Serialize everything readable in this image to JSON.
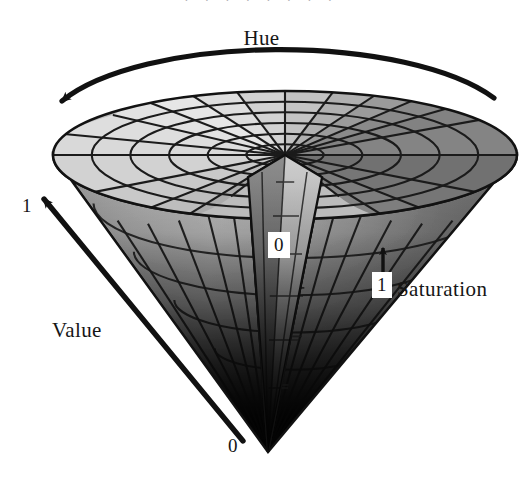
{
  "figure": {
    "title_visible": false,
    "colorspace": "grayscale",
    "background_color": "#ffffff",
    "ink_color": "#161616"
  },
  "labels": {
    "hue": "Hue",
    "value": "Value",
    "saturation": "Saturation"
  },
  "ticks": {
    "value_max": "1",
    "value_min": "0",
    "saturation_min": "0",
    "saturation_max": "1"
  },
  "scan": {
    "top_remnant": ". . . . . . . ."
  },
  "axes": {
    "hue": {
      "label": "Hue",
      "type": "angular",
      "arrow": "arc",
      "direction": "right-to-left",
      "arrowhead_at": "left"
    },
    "value": {
      "label": "Value",
      "type": "linear",
      "arrow": "straight",
      "min": "0",
      "max": "1",
      "direction": "apex-to-rim",
      "arrowhead_at": "upper-left"
    },
    "saturation": {
      "label": "Saturation",
      "type": "radial",
      "arrow": "straight",
      "min": "0",
      "max": "1",
      "direction": "center-to-rim",
      "arrowhead_at": "right"
    }
  },
  "geometry": {
    "cone_apex": {
      "x": 268,
      "y": 452
    },
    "disc_center": {
      "x": 285,
      "y": 155
    },
    "disc_radius_x": 232,
    "disc_radius_y": 64,
    "hue_sectors": 18,
    "saturation_rings": 6,
    "wedge_cut": true,
    "wedge_start_deg": 252,
    "wedge_end_deg": 288
  },
  "shading": {
    "sector_grays": [
      "#d9d9d9",
      "#d2d2d2",
      "#c9c9c9",
      "#bdbdbd",
      "#ababab",
      "#9a9a9a",
      "#8c8c8c",
      "#848484",
      "#828282",
      "#8a8a8a",
      "#9b9b9b",
      "#b0b0b0",
      "#c3c3c3",
      "#d2d2d2",
      "#dedede",
      "#e6e6e6",
      "#e2e2e2",
      "#dedede"
    ],
    "apex_gray": "#0d0d0d",
    "grid_line_color": "#191919"
  }
}
